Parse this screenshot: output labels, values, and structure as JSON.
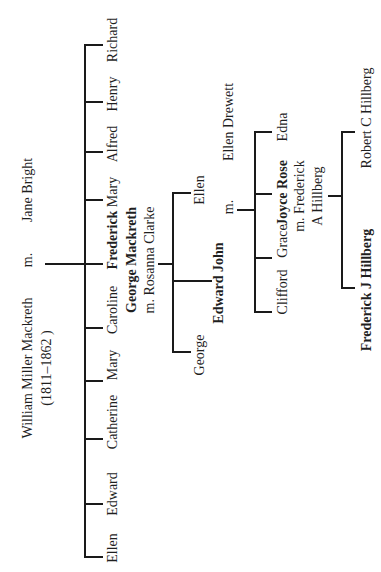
{
  "tree": {
    "root": {
      "name": "William Miller Mackreth",
      "dates": "(1811–1862 )",
      "marriage_label": "m.",
      "spouse": "Jane Bright"
    },
    "children": [
      {
        "name": "Ellen"
      },
      {
        "name": "Edward"
      },
      {
        "name": "Catherine"
      },
      {
        "name": "Mary"
      },
      {
        "name": "Caroline"
      },
      {
        "name": "Frederick George Mackreth",
        "line1": "Frederick",
        "line2": "George Mackreth",
        "spouse_line": "m. Rosanna Clarke",
        "bold": true
      },
      {
        "name": "Mary"
      },
      {
        "name": "Alfred"
      },
      {
        "name": "Henry"
      },
      {
        "name": "Richard"
      }
    ],
    "frederick_children": [
      {
        "name": "George"
      },
      {
        "name": "Edward John",
        "bold": true,
        "marriage_label": "m.",
        "spouse": "Ellen Drewett"
      },
      {
        "name": "Ellen"
      }
    ],
    "edward_children": [
      {
        "name": "Clifford"
      },
      {
        "name": "Grace"
      },
      {
        "name": "Joyce Rose",
        "bold": true,
        "spouse_line1": "m. Frederick",
        "spouse_line2": "A Hillberg"
      },
      {
        "name": "Edna"
      }
    ],
    "joyce_children": [
      {
        "name": "Frederick J Hillberg",
        "bold": true
      },
      {
        "name": "Robert C Hillberg"
      }
    ]
  }
}
